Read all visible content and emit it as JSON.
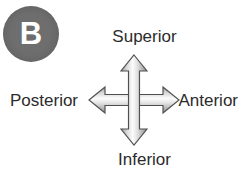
{
  "figure": {
    "panel_label": "B",
    "background_color": "#ffffff",
    "badge_color": "#6e6e6e",
    "badge_text_color": "#ffffff",
    "label_color": "#2b2b2b",
    "arrow_outline_color": "#4a4a4a",
    "arrow_fill_light": "#ffffff",
    "arrow_fill_mid": "#d9d9d9",
    "arrow_fill_dark": "#8f8f8f"
  },
  "directions": {
    "up": "Superior",
    "down": "Inferior",
    "left": "Posterior",
    "right": "Anterior"
  },
  "icons": {
    "cross_arrow": "four-way-arrow-icon"
  }
}
